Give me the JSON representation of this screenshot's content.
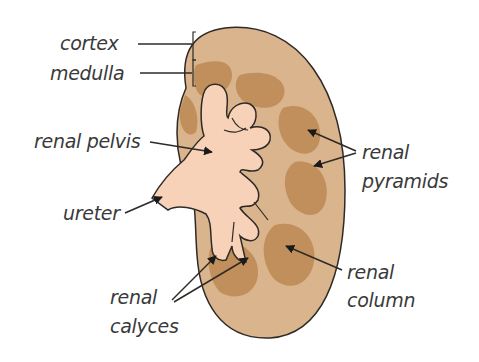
{
  "diagram": {
    "labels": {
      "cortex": "cortex",
      "medulla": "medulla",
      "renal_pelvis": "renal pelvis",
      "ureter": "ureter",
      "renal_pyramids_line1": "renal",
      "renal_pyramids_line2": "pyramids",
      "renal_column_line1": "renal",
      "renal_column_line2": "column",
      "renal_calyces_line1": "renal",
      "renal_calyces_line2": "calyces"
    },
    "colors": {
      "cortex": "#d9b48c",
      "medulla_pyramid": "#c08f5c",
      "pelvis": "#f7d2b8",
      "outline": "#2e2a26",
      "label_text": "#3a3a3a",
      "background": "#ffffff"
    }
  }
}
